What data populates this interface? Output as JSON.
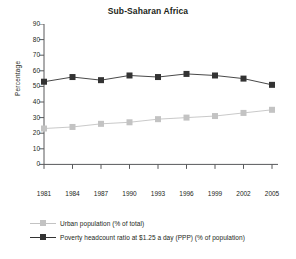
{
  "chart_data": {
    "type": "line",
    "title": "Sub-Saharan Africa",
    "xlabel": "",
    "ylabel": "Percentage",
    "categories": [
      "1981",
      "1984",
      "1987",
      "1990",
      "1993",
      "1996",
      "1999",
      "2002",
      "2005"
    ],
    "x": [
      1981,
      1984,
      1987,
      1990,
      1993,
      1996,
      1999,
      2002,
      2005
    ],
    "ylim": [
      0,
      90
    ],
    "yticks": [
      0,
      10,
      20,
      30,
      40,
      50,
      60,
      70,
      80,
      90
    ],
    "grid": false,
    "legend_position": "bottom-left",
    "series": [
      {
        "name": "Urban population (% of total)",
        "values": [
          23,
          24,
          26,
          27,
          29,
          30,
          31,
          33,
          35
        ],
        "color": "#c3c3c3",
        "marker": "square"
      },
      {
        "name": "Poverty headcount ratio at $1.25 a day (PPP) (% of population)",
        "values": [
          53,
          56,
          54,
          57,
          56,
          58,
          57,
          55,
          51
        ],
        "color": "#333333",
        "marker": "square"
      }
    ]
  },
  "axes": {
    "ylabel": "Percentage",
    "ytick_labels": [
      "90",
      "80",
      "70",
      "60",
      "50",
      "40",
      "30",
      "20",
      "10",
      "0"
    ],
    "xtick_labels": [
      "1981",
      "1984",
      "1987",
      "1990",
      "1993",
      "1996",
      "1999",
      "2002",
      "2005"
    ]
  },
  "legend": {
    "items": [
      {
        "label": "Urban population (% of total)",
        "color": "#c3c3c3"
      },
      {
        "label": "Poverty headcount ratio at $1.25 a day (PPP) (% of population)",
        "color": "#333333"
      }
    ]
  },
  "colors": {
    "axis": "#58595b",
    "text": "#231f20",
    "series_light": "#c3c3c3",
    "series_dark": "#333333",
    "background": "#ffffff"
  }
}
